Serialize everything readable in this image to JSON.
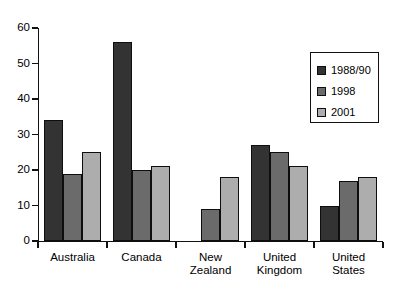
{
  "chart_data": {
    "type": "bar",
    "title": "",
    "subtitle": "",
    "xlabel": "",
    "ylabel": "",
    "ylim": [
      0,
      60
    ],
    "yticks": [
      0,
      10,
      20,
      30,
      40,
      50,
      60
    ],
    "grid": false,
    "legend_position": "upper-right",
    "categories": [
      "Australia",
      "Canada",
      "New Zealand",
      "United Kingdom",
      "United States"
    ],
    "series": [
      {
        "name": "1988/90",
        "color": "#333333",
        "values": [
          34,
          56,
          null,
          27,
          10
        ]
      },
      {
        "name": "1998",
        "color": "#6b6b6b",
        "values": [
          19,
          20,
          9,
          25,
          17
        ]
      },
      {
        "name": "2001",
        "color": "#adadad",
        "values": [
          25,
          21,
          18,
          21,
          18
        ]
      }
    ]
  },
  "axis": {
    "y_tick_labels": [
      "0",
      "10",
      "20",
      "30",
      "40",
      "50",
      "60"
    ]
  },
  "categories_display": [
    "Australia",
    "Canada",
    "New\nZealand",
    "United\nKingdom",
    "United\nStates"
  ],
  "legend": {
    "entries": [
      {
        "label": "1988/90"
      },
      {
        "label": "1998"
      },
      {
        "label": "2001"
      }
    ]
  },
  "colors": {
    "series_1988_90": "#333333",
    "series_1998": "#6b6b6b",
    "series_2001": "#adadad",
    "axis": "#111111",
    "background": "#ffffff",
    "text": "#000000"
  }
}
